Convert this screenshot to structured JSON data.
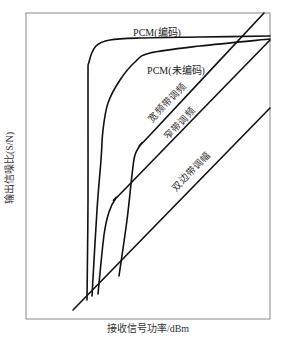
{
  "chart_data": {
    "type": "line",
    "title": "",
    "xlabel": "接收信号功率/dBm",
    "ylabel": "输出信噪比(S/N)",
    "grid": false,
    "legend": "none (inline curve labels)",
    "axis_ticks": "none",
    "frame": {
      "x0": 26,
      "y0": 13,
      "x1": 270,
      "y1": 319
    },
    "series": [
      {
        "name": "PCM(编码)",
        "description": "sharp threshold at lowest received power, then flat high S/N",
        "points_px": [
          [
            87,
            300
          ],
          [
            88,
            200
          ],
          [
            88,
            80
          ],
          [
            89,
            62
          ],
          [
            96,
            46
          ],
          [
            110,
            40
          ],
          [
            140,
            38
          ],
          [
            200,
            37
          ],
          [
            270,
            36
          ]
        ],
        "label": {
          "text": "PCM(编码)",
          "x": 157,
          "y": 34,
          "rotate": 0
        }
      },
      {
        "name": "PCM(未编码)",
        "description": "threshold slightly above coded PCM, then slowly rising S/N",
        "points_px": [
          [
            92,
            296
          ],
          [
            97,
            210
          ],
          [
            101,
            160
          ],
          [
            103,
            130
          ],
          [
            108,
            103
          ],
          [
            120,
            80
          ],
          [
            135,
            62
          ],
          [
            150,
            53
          ],
          [
            200,
            46
          ],
          [
            270,
            39
          ]
        ],
        "label": {
          "text": "PCM(未编码)",
          "x": 176,
          "y": 72,
          "rotate": 0
        }
      },
      {
        "name": "窄带调频",
        "description": "narrowband FM: linear above threshold, steep drop below",
        "points_px": [
          [
            98,
            294
          ],
          [
            104,
            235
          ],
          [
            109,
            212
          ],
          [
            116,
            198
          ],
          [
            128,
            186
          ],
          [
            270,
            40
          ]
        ],
        "label": {
          "text": "窄带调频",
          "x": 180,
          "y": 124,
          "rotate": -46
        }
      },
      {
        "name": "宽频带调频",
        "description": "wideband FM: highest slope region, threshold at higher power",
        "points_px": [
          [
            119,
            276
          ],
          [
            127,
            220
          ],
          [
            132,
            175
          ],
          [
            135,
            155
          ],
          [
            142,
            143
          ],
          [
            150,
            135
          ],
          [
            264,
            13
          ]
        ],
        "label": {
          "text": "宽频带调频",
          "x": 168,
          "y": 103,
          "rotate": -46
        }
      },
      {
        "name": "双边带调幅",
        "description": "DSB-AM: linear S/N vs received power, no threshold",
        "points_px": [
          [
            73,
            310
          ],
          [
            270,
            108
          ]
        ],
        "label": {
          "text": "双边带调幅",
          "x": 192,
          "y": 172,
          "rotate": -46
        }
      }
    ]
  },
  "axes": {
    "x_label": "接收信号功率/dBm",
    "y_label": "输出信噪比(S/N)"
  }
}
